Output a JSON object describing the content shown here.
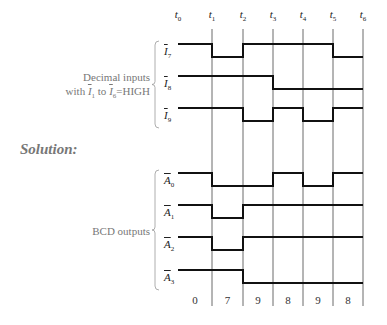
{
  "time_labels": [
    {
      "base": "t",
      "sub": "0",
      "x": 178
    },
    {
      "base": "t",
      "sub": "1",
      "x": 212
    },
    {
      "base": "t",
      "sub": "2",
      "x": 243
    },
    {
      "base": "t",
      "sub": "3",
      "x": 273
    },
    {
      "base": "t",
      "sub": "4",
      "x": 303
    },
    {
      "base": "t",
      "sub": "5",
      "x": 333
    },
    {
      "base": "t",
      "sub": "6",
      "x": 363
    }
  ],
  "inputs_group": {
    "line1": "Decimal inputs",
    "line2_prefix": "with ",
    "line2_a": "I",
    "line2_a_sub": "1",
    "line2_mid": " to ",
    "line2_b": "I",
    "line2_b_sub": "6",
    "line2_suffix": "=HIGH"
  },
  "solution_label": "Solution:",
  "outputs_group": {
    "label": "BCD outputs"
  },
  "signals": [
    {
      "name": "I",
      "sub": "7",
      "high_y": 44,
      "levels": [
        1,
        0,
        1,
        1,
        1,
        0
      ]
    },
    {
      "name": "I",
      "sub": "8",
      "high_y": 76,
      "levels": [
        1,
        1,
        1,
        0,
        0,
        0
      ]
    },
    {
      "name": "I",
      "sub": "9",
      "high_y": 108,
      "levels": [
        1,
        1,
        0,
        1,
        0,
        1
      ]
    },
    {
      "name": "A",
      "sub": "0",
      "high_y": 173,
      "levels": [
        1,
        0,
        0,
        1,
        0,
        1
      ]
    },
    {
      "name": "A",
      "sub": "1",
      "high_y": 205,
      "levels": [
        1,
        0,
        1,
        1,
        1,
        1
      ]
    },
    {
      "name": "A",
      "sub": "2",
      "high_y": 237,
      "levels": [
        1,
        0,
        1,
        1,
        1,
        1
      ]
    },
    {
      "name": "A",
      "sub": "3",
      "high_y": 270,
      "levels": [
        1,
        1,
        0,
        0,
        0,
        0
      ]
    }
  ],
  "bcd_codes": [
    "0",
    "7",
    "9",
    "8",
    "9",
    "8"
  ],
  "chart_data": {
    "type": "timing",
    "time_points": [
      "t0",
      "t1",
      "t2",
      "t3",
      "t4",
      "t5",
      "t6"
    ],
    "inputs": {
      "I7_bar": [
        1,
        0,
        1,
        1,
        1,
        0
      ],
      "I8_bar": [
        1,
        1,
        1,
        0,
        0,
        0
      ],
      "I9_bar": [
        1,
        1,
        0,
        1,
        0,
        1
      ]
    },
    "outputs": {
      "A0_bar": [
        1,
        0,
        0,
        1,
        0,
        1
      ],
      "A1_bar": [
        1,
        0,
        1,
        1,
        1,
        1
      ],
      "A2_bar": [
        1,
        0,
        1,
        1,
        1,
        1
      ],
      "A3_bar": [
        1,
        1,
        0,
        0,
        0,
        0
      ]
    },
    "decimal_values": [
      0,
      7,
      9,
      8,
      9,
      8
    ]
  }
}
